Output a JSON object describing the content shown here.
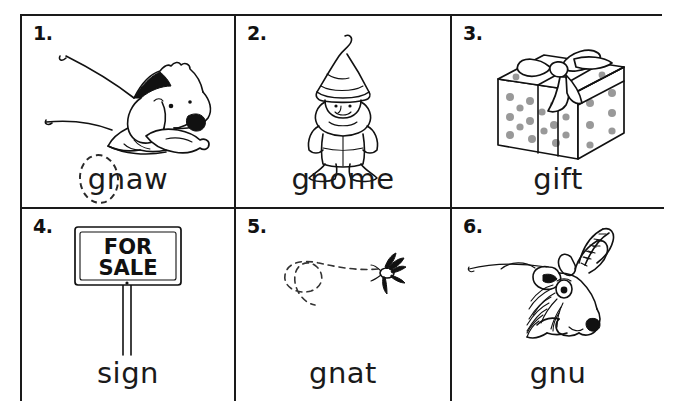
{
  "worksheet": {
    "title": "gn words picture worksheet",
    "grid": {
      "columns": 3,
      "rows": 2
    },
    "ink_color": "#111111",
    "dot_color": "#999999",
    "background": "#ffffff"
  },
  "cells": [
    {
      "number": "1.",
      "word": "gnaw",
      "picture": "dog-chewing-bone",
      "circled": true,
      "circled_letters": "g"
    },
    {
      "number": "2.",
      "word": "gnome",
      "picture": "garden-gnome",
      "circled": false,
      "circled_letters": ""
    },
    {
      "number": "3.",
      "word": "gift",
      "picture": "gift-box-with-bow",
      "circled": false,
      "circled_letters": ""
    },
    {
      "number": "4.",
      "word": "sign",
      "picture": "for-sale-sign",
      "circled": false,
      "circled_letters": "",
      "sign_line_one": "FOR",
      "sign_line_two": "SALE"
    },
    {
      "number": "5.",
      "word": "gnat",
      "picture": "flying-gnat-with-dashed-path",
      "circled": false,
      "circled_letters": ""
    },
    {
      "number": "6.",
      "word": "gnu",
      "picture": "gnu-wildebeest-head",
      "circled": false,
      "circled_letters": ""
    }
  ]
}
